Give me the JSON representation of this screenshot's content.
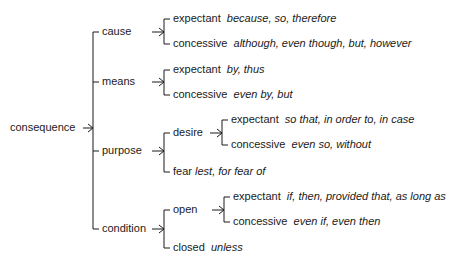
{
  "root": {
    "label": "consequence"
  },
  "branches": [
    {
      "label": "cause",
      "children": [
        {
          "label": "expectant",
          "examples": "because, so, therefore"
        },
        {
          "label": "concessive",
          "examples": "although, even though, but, however"
        }
      ]
    },
    {
      "label": "means",
      "children": [
        {
          "label": "expectant",
          "examples": "by, thus"
        },
        {
          "label": "concessive",
          "examples": "even by, but"
        }
      ]
    },
    {
      "label": "purpose",
      "children": [
        {
          "label": "desire",
          "children": [
            {
              "label": "expectant",
              "examples": "so that, in order to, in case"
            },
            {
              "label": "concessive",
              "examples": "even so, without"
            }
          ]
        },
        {
          "label": "fear",
          "examples": "lest, for fear of"
        }
      ]
    },
    {
      "label": "condition",
      "children": [
        {
          "label": "open",
          "children": [
            {
              "label": "expectant",
              "examples": "if, then, provided that, as long as"
            },
            {
              "label": "concessive",
              "examples": "even if, even then"
            }
          ]
        },
        {
          "label": "closed",
          "examples": "unless"
        }
      ]
    }
  ]
}
